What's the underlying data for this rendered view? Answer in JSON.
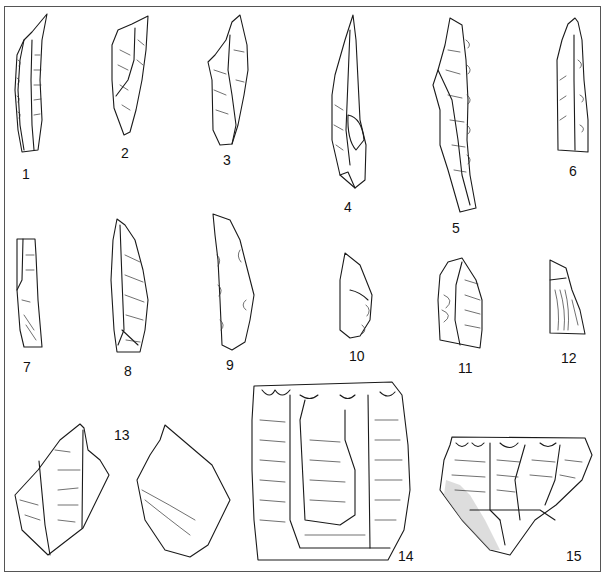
{
  "figure": {
    "border_color": "#555555",
    "line_color": "#1a1a1a",
    "background": "#ffffff"
  },
  "artifacts": [
    {
      "id": 1,
      "label": "1",
      "type": "blade"
    },
    {
      "id": 2,
      "label": "2",
      "type": "blade"
    },
    {
      "id": 3,
      "label": "3",
      "type": "blade"
    },
    {
      "id": 4,
      "label": "4",
      "type": "pointed blade"
    },
    {
      "id": 5,
      "label": "5",
      "type": "retouched blade"
    },
    {
      "id": 6,
      "label": "6",
      "type": "blade"
    },
    {
      "id": 7,
      "label": "7",
      "type": "truncated blade"
    },
    {
      "id": 8,
      "label": "8",
      "type": "pointed blade"
    },
    {
      "id": 9,
      "label": "9",
      "type": "notched blade"
    },
    {
      "id": 10,
      "label": "10",
      "type": "flake"
    },
    {
      "id": 11,
      "label": "11",
      "type": "flake"
    },
    {
      "id": 12,
      "label": "12",
      "type": "flake"
    },
    {
      "id": 13,
      "label": "13",
      "type": "flake (two faces)"
    },
    {
      "id": 14,
      "label": "14",
      "type": "end scraper / core"
    },
    {
      "id": 15,
      "label": "15",
      "type": "end scraper"
    }
  ]
}
